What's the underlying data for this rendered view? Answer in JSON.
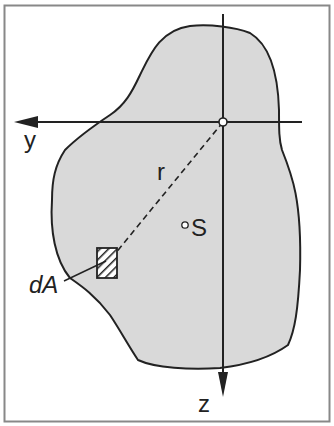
{
  "diagram": {
    "labels": {
      "y_axis": "y",
      "z_axis": "z",
      "radius": "r",
      "centroid": "S",
      "area_element": "dA"
    },
    "colors": {
      "fill": "#d9d9d9",
      "stroke": "#222222",
      "frame": "#888888",
      "background": "#ffffff"
    }
  }
}
